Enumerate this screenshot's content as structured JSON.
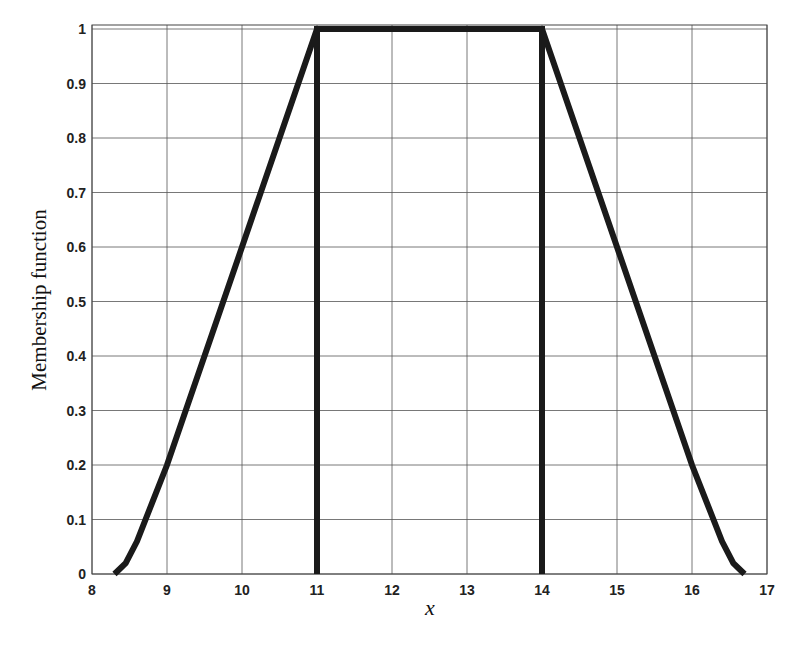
{
  "chart_data": {
    "type": "line",
    "title": "",
    "xlabel": "x",
    "ylabel": "Membership function",
    "xlim": [
      8,
      17
    ],
    "ylim": [
      0,
      1
    ],
    "grid": true,
    "legend": null,
    "x_ticks": [
      "8",
      "9",
      "10",
      "11",
      "12",
      "13",
      "14",
      "15",
      "16",
      "17"
    ],
    "y_ticks": [
      "0",
      "0.1",
      "0.2",
      "0.3",
      "0.4",
      "0.5",
      "0.6",
      "0.7",
      "0.8",
      "0.9",
      "1"
    ],
    "series": [
      {
        "name": "membership",
        "x": [
          8.3,
          8.45,
          8.6,
          8.8,
          9.0,
          9.3,
          9.6,
          10.0,
          10.5,
          11.0,
          11.0,
          11.0,
          14.0,
          14.0,
          14.0,
          14.5,
          15.0,
          15.5,
          16.0,
          16.2,
          16.4,
          16.55,
          16.7
        ],
        "y": [
          0.0,
          0.02,
          0.06,
          0.13,
          0.2,
          0.32,
          0.44,
          0.6,
          0.8,
          1.0,
          0.0,
          1.0,
          1.0,
          0.0,
          1.0,
          0.8,
          0.6,
          0.4,
          0.2,
          0.13,
          0.06,
          0.02,
          0.0
        ]
      }
    ],
    "annotations": []
  }
}
